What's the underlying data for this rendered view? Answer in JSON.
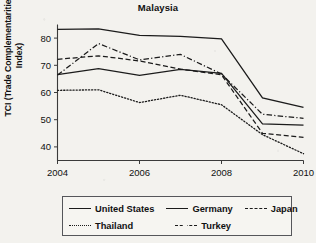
{
  "chart_data": {
    "type": "line",
    "title": "Malaysia",
    "xlabel": "",
    "ylabel": "TCI (Trade Complementarities Index)",
    "ylabel_line1": "TCI (Trade Complementarities",
    "ylabel_line2": "Index)",
    "x": [
      2004,
      2005,
      2006,
      2007,
      2008,
      2009,
      2010
    ],
    "xtick_labels": [
      "2004",
      "2006",
      "2008",
      "2010"
    ],
    "xticks": [
      2004,
      2006,
      2008,
      2010
    ],
    "ytick_labels": [
      "40",
      "50",
      "60",
      "70",
      "80"
    ],
    "yticks": [
      40,
      50,
      60,
      70,
      80
    ],
    "xlim": [
      2004,
      2010
    ],
    "ylim": [
      35,
      85
    ],
    "grid": false,
    "legend_position": "below-axes",
    "series": [
      {
        "name": "United States",
        "style": "solid",
        "color": "#1b1b1b",
        "values": [
          83.2,
          83.4,
          81.0,
          80.6,
          79.7,
          58.0,
          54.5
        ]
      },
      {
        "name": "Germany",
        "style": "solid",
        "color": "#1b1b1b",
        "values": [
          66.6,
          68.8,
          66.3,
          68.5,
          67.0,
          48.5,
          48.0
        ]
      },
      {
        "name": "Japan",
        "style": "dashed",
        "color": "#1b1b1b",
        "values": [
          72.2,
          73.5,
          71.6,
          68.6,
          66.5,
          45.0,
          43.5
        ]
      },
      {
        "name": "Thailand",
        "style": "dotted",
        "color": "#1b1b1b",
        "values": [
          60.8,
          61.0,
          56.3,
          59.0,
          55.5,
          44.5,
          37.5
        ]
      },
      {
        "name": "Turkey",
        "style": "dashdot",
        "color": "#1b1b1b",
        "values": [
          66.4,
          78.0,
          72.0,
          74.0,
          66.8,
          52.0,
          50.5
        ]
      }
    ]
  },
  "legend": {
    "entries": [
      {
        "label": "United States",
        "style": "solid"
      },
      {
        "label": "Germany",
        "style": "solid"
      },
      {
        "label": "Japan",
        "style": "dashed"
      },
      {
        "label": "Thailand",
        "style": "dotted"
      },
      {
        "label": "Turkey",
        "style": "dashdot"
      }
    ]
  }
}
